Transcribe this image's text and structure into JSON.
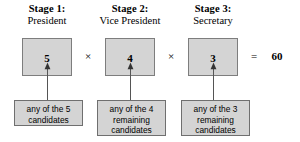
{
  "diagram": {
    "result_operator": "=",
    "result_value": "60",
    "multiply_operator": "×",
    "colors": {
      "box_fill": "#d4d4d4",
      "box_border": "#7d7d7d",
      "text": "#000000",
      "background": "#ffffff",
      "connector": "#555555"
    },
    "stages": [
      {
        "stage_label": "Stage 1:",
        "role_label": "President",
        "count": "5",
        "description_lines": [
          "any of the 5",
          "candidates"
        ]
      },
      {
        "stage_label": "Stage 2:",
        "role_label": "Vice President",
        "count": "4",
        "description_lines": [
          "any of the 4",
          "remaining",
          "candidates"
        ]
      },
      {
        "stage_label": "Stage 3:",
        "role_label": "Secretary",
        "count": "3",
        "description_lines": [
          "any of the 3",
          "remaining",
          "candidates"
        ]
      }
    ]
  }
}
